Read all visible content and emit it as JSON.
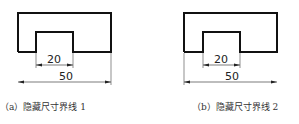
{
  "figures": [
    {
      "id": "a",
      "caption": "（a）隐藏尺寸界线 1",
      "dim_inner": "20",
      "dim_outer": "50",
      "hidden_extension_side": "left"
    },
    {
      "id": "b",
      "caption": "（b）隐藏尺寸界线 2",
      "dim_inner": "20",
      "dim_outer": "50",
      "hidden_extension_side": "right"
    }
  ],
  "colors": {
    "outline": "#111111",
    "dimension": "#444444"
  }
}
